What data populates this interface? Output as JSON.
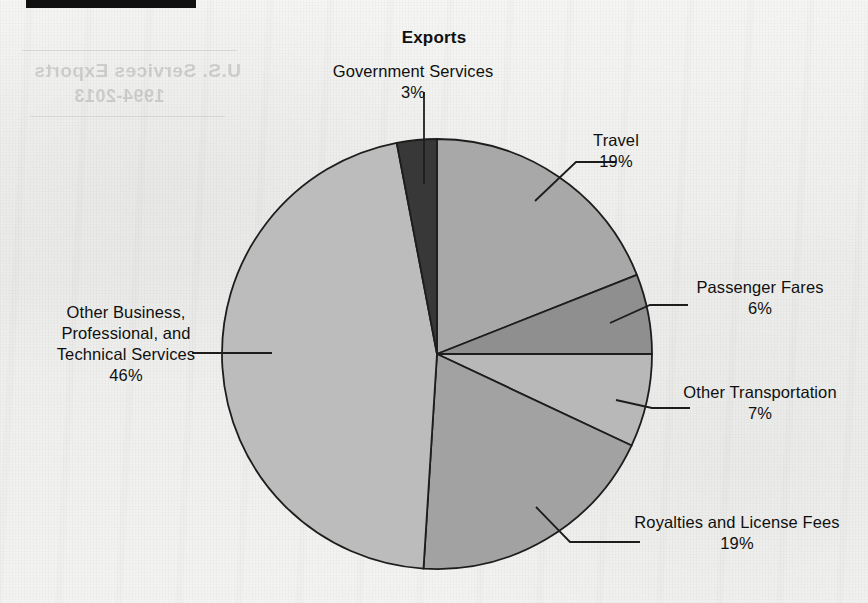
{
  "chart_data": {
    "type": "pie",
    "title": "Exports",
    "xlabel": "",
    "ylabel": "",
    "legend_position": "none",
    "grid": false,
    "categories": [
      "Travel",
      "Passenger Fares",
      "Other Transportation",
      "Royalties and License Fees",
      "Other Business, Professional, and Technical Services",
      "Government Services"
    ],
    "values": [
      19,
      6,
      7,
      19,
      46,
      3
    ],
    "value_unit": "%",
    "slices": [
      {
        "name": "Travel",
        "label_lines": [
          "Travel"
        ],
        "percent": 19,
        "percent_text": "19%",
        "color": "#a8a8a8",
        "start_angle_deg": 0,
        "end_angle_deg": 68.4
      },
      {
        "name": "Passenger Fares",
        "label_lines": [
          "Passenger Fares"
        ],
        "percent": 6,
        "percent_text": "6%",
        "color": "#8f8f8f",
        "start_angle_deg": 68.4,
        "end_angle_deg": 90.0
      },
      {
        "name": "Other Transportation",
        "label_lines": [
          "Other Transportation"
        ],
        "percent": 7,
        "percent_text": "7%",
        "color": "#b8b8b8",
        "start_angle_deg": 90.0,
        "end_angle_deg": 115.2
      },
      {
        "name": "Royalties and License Fees",
        "label_lines": [
          "Royalties and License Fees"
        ],
        "percent": 19,
        "percent_text": "19%",
        "color": "#a2a2a2",
        "start_angle_deg": 115.2,
        "end_angle_deg": 183.6
      },
      {
        "name": "Other Business, Professional, and Technical Services",
        "label_lines": [
          "Other Business,",
          "Professional, and",
          "Technical Services"
        ],
        "percent": 46,
        "percent_text": "46%",
        "color": "#bcbcbc",
        "start_angle_deg": 183.6,
        "end_angle_deg": 349.2
      },
      {
        "name": "Government Services",
        "label_lines": [
          "Government Services"
        ],
        "percent": 3,
        "percent_text": "3%",
        "color": "#383838",
        "start_angle_deg": 349.2,
        "end_angle_deg": 360.0
      }
    ]
  },
  "chart": {
    "title": "Exports"
  },
  "labels": {
    "government": {
      "line1": "Government Services",
      "pct": "3%"
    },
    "travel": {
      "line1": "Travel",
      "pct": "19%"
    },
    "passenger": {
      "line1": "Passenger Fares",
      "pct": "6%"
    },
    "othertrans": {
      "line1": "Other Transportation",
      "pct": "7%"
    },
    "royalties": {
      "line1": "Royalties and License Fees",
      "pct": "19%"
    },
    "otherbiz": {
      "line1": "Other Business,",
      "line2": "Professional, and",
      "line3": "Technical Services",
      "pct": "46%"
    }
  },
  "artifacts": {
    "bleed_through_line_1": "U.S. Services Exports",
    "bleed_through_line_2": "1994-2013"
  },
  "colors": {
    "outline": "#1d1d1d",
    "text": "#101010",
    "paper": "#f2f2f0",
    "scan_bar": "#111111"
  }
}
